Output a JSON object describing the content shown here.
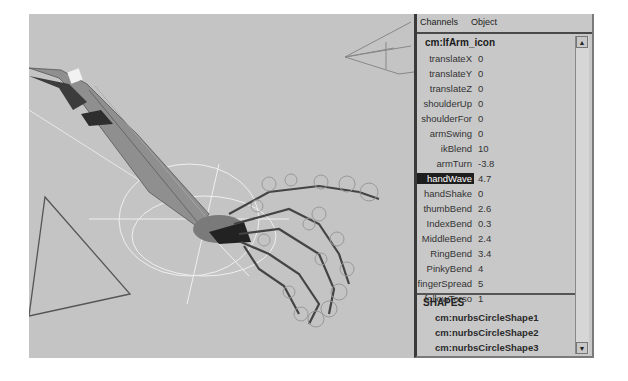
{
  "channel_box": {
    "menu": [
      "Channels",
      "Object"
    ],
    "node": "cm:lfArm_icon",
    "channels": [
      {
        "label": "translateX",
        "value": "0"
      },
      {
        "label": "translateY",
        "value": "0"
      },
      {
        "label": "translateZ",
        "value": "0"
      },
      {
        "label": "shoulderUp",
        "value": "0"
      },
      {
        "label": "shoulderFor",
        "value": "0"
      },
      {
        "label": "armSwing",
        "value": "0"
      },
      {
        "label": "ikBlend",
        "value": "10"
      },
      {
        "label": "armTurn",
        "value": "-3.8"
      },
      {
        "label": "handWave",
        "value": "4.7",
        "selected": true
      },
      {
        "label": "handShake",
        "value": "0"
      },
      {
        "label": "thumbBend",
        "value": "2.6"
      },
      {
        "label": "IndexBend",
        "value": "0.3"
      },
      {
        "label": "MiddleBend",
        "value": "2.4"
      },
      {
        "label": "RingBend",
        "value": "3.4"
      },
      {
        "label": "PinkyBend",
        "value": "4"
      },
      {
        "label": "fingerSpread",
        "value": "5"
      },
      {
        "label": "followTorso",
        "value": "1"
      }
    ],
    "shapes_header": "SHAPES",
    "shapes": [
      "cm:nurbsCircleShape1",
      "cm:nurbsCircleShape2",
      "cm:nurbsCircleShape3"
    ],
    "scroll_up": "▲",
    "scroll_down": "▼"
  },
  "viewport": {
    "content": "3D rig of arm and hand with circle controls",
    "background": "#c4c4c4"
  }
}
